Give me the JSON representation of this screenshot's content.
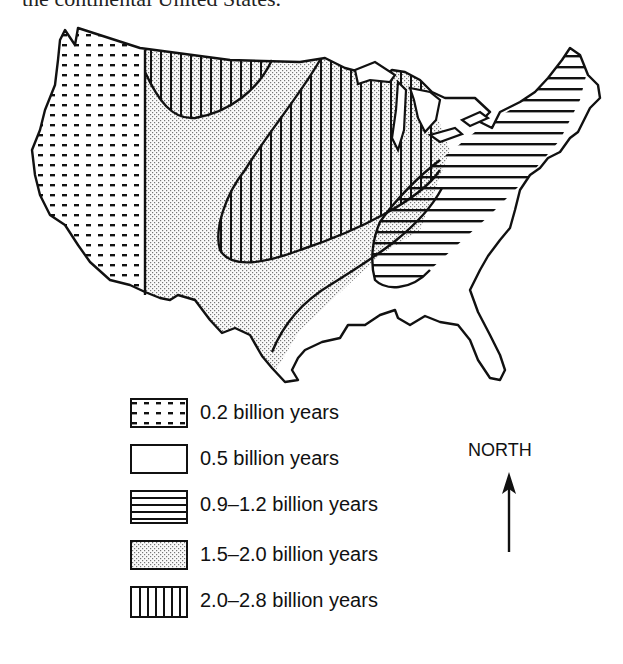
{
  "caption": "the continental United States.",
  "map": {
    "title": "Age of continental crust, continental United States",
    "regions": [
      {
        "id": "west-coast",
        "label": "0.2 billion years",
        "pattern": "dots"
      },
      {
        "id": "southeast",
        "label": "0.5 billion years",
        "pattern": "blank"
      },
      {
        "id": "appalachian-belt",
        "label": "0.9–1.2 billion years",
        "pattern": "horizontal-lines"
      },
      {
        "id": "central-band",
        "label": "1.5–2.0 billion years",
        "pattern": "stipple"
      },
      {
        "id": "northern-cores",
        "label": "2.0–2.8 billion years",
        "pattern": "vertical-lines"
      }
    ]
  },
  "legend": {
    "items": [
      {
        "label": "0.2 billion years",
        "pattern": "dots"
      },
      {
        "label": "0.5 billion years",
        "pattern": "blank"
      },
      {
        "label": "0.9–1.2 billion years",
        "pattern": "horizontal-lines"
      },
      {
        "label": "1.5–2.0 billion years",
        "pattern": "stipple"
      },
      {
        "label": "2.0–2.8 billion years",
        "pattern": "vertical-lines"
      }
    ]
  },
  "compass": {
    "label": "NORTH",
    "icon": "north-arrow-icon"
  },
  "colors": {
    "ink": "#111111",
    "stipple": "#9a9a9a",
    "background": "#ffffff"
  }
}
